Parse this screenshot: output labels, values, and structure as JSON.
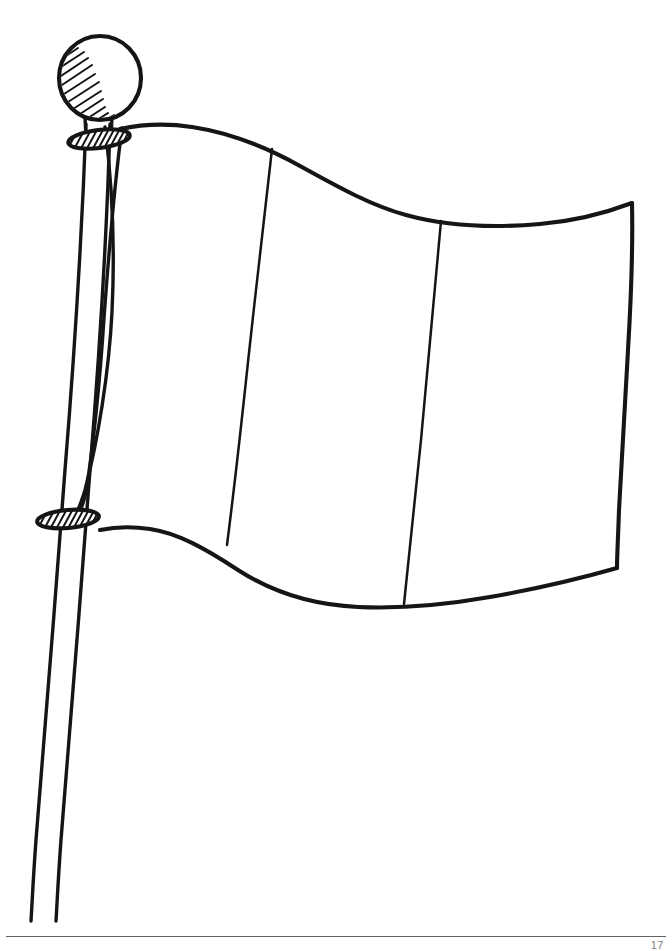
{
  "page": {
    "kind": "line-art-illustration",
    "background_color": "#ffffff",
    "ink_color": "#151515",
    "width": 672,
    "height": 951
  },
  "artwork": {
    "caption": "Black and white outline drawing of a rippling three-stripe flag attached to a tall leaning flagpole topped with a hatched spherical finial.",
    "elements": {
      "finial_ball": {
        "name": "Flagpole finial ball",
        "center_x": 100,
        "center_y": 78,
        "radius_x": 41,
        "radius_y": 42,
        "shading": "diagonal hatching along the lower-left inner arc"
      },
      "top_ring": {
        "name": "Upper hatched collar ring",
        "center_x": 99,
        "center_y": 139,
        "radius_x": 31,
        "radius_y": 9,
        "rotation_deg": -7,
        "shading": "diagonal hatch fill"
      },
      "bottom_ring": {
        "name": "Lower hatched collar ring",
        "center_x": 68,
        "center_y": 519,
        "radius_x": 31,
        "radius_y": 9,
        "rotation_deg": -5,
        "shading": "diagonal hatch fill"
      },
      "pole": {
        "name": "Flagpole",
        "top_x": 88,
        "top_y": 120,
        "bottom_y": 921,
        "bottom_x": 33,
        "line_count": 2
      },
      "hoist_curve": {
        "name": "Flag hoist edge bulging away from the pole"
      },
      "flag": {
        "name": "Flag cloth",
        "top_left_x": 122,
        "top_left_y": 128,
        "top_right_x": 632,
        "top_right_y": 203,
        "bottom_right_x": 617,
        "bottom_right_y": 568,
        "bottom_left_x": 100,
        "bottom_left_y": 527,
        "stripe_count": 3,
        "stripe_dividers": 2
      }
    }
  },
  "footer": {
    "rule_color": "#636363",
    "page_number": "17"
  }
}
